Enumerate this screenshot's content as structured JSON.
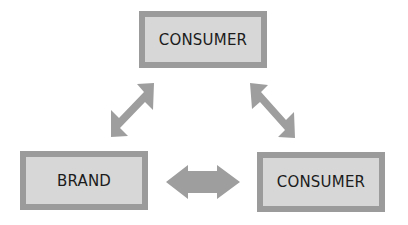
{
  "diagram": {
    "type": "relationship-triangle",
    "nodes": [
      {
        "id": "top",
        "label": "CONSUMER"
      },
      {
        "id": "brand",
        "label": "BRAND"
      },
      {
        "id": "right",
        "label": "CONSUMER"
      }
    ],
    "edges": [
      {
        "from": "brand",
        "to": "top",
        "style": "double-headed-arrow"
      },
      {
        "from": "top",
        "to": "right",
        "style": "double-headed-arrow"
      },
      {
        "from": "brand",
        "to": "right",
        "style": "double-headed-arrow"
      }
    ],
    "colors": {
      "box_border": "#9b9b9b",
      "box_fill": "#d7d7d7",
      "arrow_fill": "#9e9e9e",
      "text": "#1c1c1c",
      "background": "#ffffff"
    }
  }
}
